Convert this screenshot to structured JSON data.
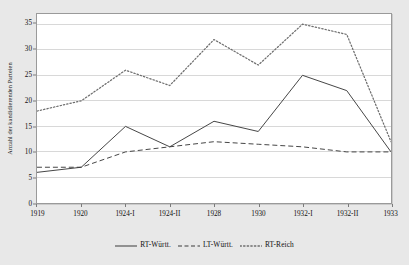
{
  "chart_data": {
    "type": "line",
    "title": "",
    "xlabel": "",
    "ylabel": "Anzahl der kandidierenden Parteien",
    "categories": [
      "1919",
      "1920",
      "1924-I",
      "1924-II",
      "1928",
      "1930",
      "1932-I",
      "1932-II",
      "1933"
    ],
    "ylim": [
      0,
      37
    ],
    "yticks": [
      0,
      5,
      10,
      15,
      20,
      25,
      30,
      35
    ],
    "ytick_labels": [
      "0",
      "5",
      "10",
      "15",
      "20",
      "25",
      "30",
      "35"
    ],
    "grid": true,
    "grid_axis": "y",
    "legend_position": "bottom-center",
    "series": [
      {
        "name": "RT-Württ.",
        "style": "solid",
        "color": "#3a3a3a",
        "values": [
          6,
          7,
          15,
          11,
          16,
          14,
          25,
          22,
          10
        ]
      },
      {
        "name": "LT-Württ.",
        "style": "dashed",
        "color": "#3a3a3a",
        "values": [
          7,
          7,
          10,
          11,
          12,
          11.5,
          11,
          10,
          10
        ]
      },
      {
        "name": "RT-Reich",
        "style": "dotted",
        "color": "#6e6e6e",
        "values": [
          18,
          20,
          26,
          23,
          32,
          27,
          35,
          33,
          12
        ]
      }
    ]
  },
  "colors": {
    "figure_background": "#e8e8e8",
    "plot_background": "#ffffff",
    "axis": "#9a9a9a",
    "gridline": "#d8d8d8",
    "text": "#111111"
  }
}
